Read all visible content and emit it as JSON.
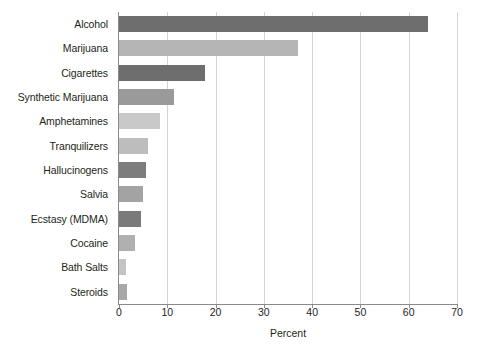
{
  "chart_data": {
    "type": "bar",
    "orientation": "horizontal",
    "title": "",
    "xlabel": "Percent",
    "ylabel": "",
    "xlim": [
      0,
      70
    ],
    "xticks": [
      0,
      10,
      20,
      30,
      40,
      50,
      60,
      70
    ],
    "xtick_labels": [
      "0",
      "10",
      "20",
      "30",
      "40",
      "50",
      "60",
      "70"
    ],
    "grid": "vertical",
    "legend": "none",
    "categories": [
      "Alcohol",
      "Marijuana",
      "Cigarettes",
      "Synthetic Marijuana",
      "Amphetamines",
      "Tranquilizers",
      "Hallucinogens",
      "Salvia",
      "Ecstasy (MDMA)",
      "Cocaine",
      "Bath Salts",
      "Steroids"
    ],
    "values": [
      64,
      37,
      17.8,
      11.4,
      8.5,
      6,
      5.5,
      5,
      4.5,
      3.3,
      1.5,
      1.6
    ],
    "bar_colors": [
      "#6e6e6e",
      "#b5b5b5",
      "#6e6e6e",
      "#9a9a9a",
      "#c9c9c9",
      "#bdbdbd",
      "#7d7d7d",
      "#a3a3a3",
      "#7a7a7a",
      "#b0b0b0",
      "#c4c4c4",
      "#a8a8a8"
    ]
  },
  "style": {
    "background": "#ffffff",
    "axis_color": "#8a8a8a",
    "grid_color": "#d4d4d4",
    "text_color": "#231f20"
  }
}
